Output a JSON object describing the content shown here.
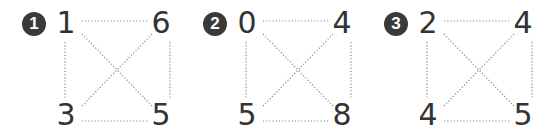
{
  "problems": [
    {
      "label": "1",
      "top_left": "1",
      "top_right": "6",
      "bottom_left": "3",
      "bottom_right": "5"
    },
    {
      "label": "2",
      "top_left": "0",
      "top_right": "4",
      "bottom_left": "5",
      "bottom_right": "8"
    },
    {
      "label": "3",
      "top_left": "2",
      "top_right": "4",
      "bottom_left": "4",
      "bottom_right": "5"
    }
  ],
  "colors": {
    "badge": "#3a3a3a",
    "digits": "#333333",
    "dotted_lines": "#8a8a8a"
  }
}
